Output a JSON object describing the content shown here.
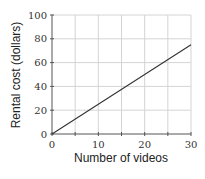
{
  "chart_data": {
    "type": "line",
    "title": "",
    "xlabel": "Number of videos",
    "ylabel": "Rental cost (dollars)",
    "xlim": [
      0,
      30
    ],
    "ylim": [
      0,
      100
    ],
    "xticks": [
      0,
      10,
      20,
      30
    ],
    "yticks": [
      0,
      20,
      40,
      60,
      80,
      100
    ],
    "grid": true,
    "x_grid_step": 5,
    "y_grid_step": 20,
    "series": [
      {
        "name": "Rental cost",
        "x": [
          0,
          10,
          20,
          30
        ],
        "y": [
          0,
          25,
          50,
          75
        ],
        "color": "#333333"
      }
    ]
  }
}
